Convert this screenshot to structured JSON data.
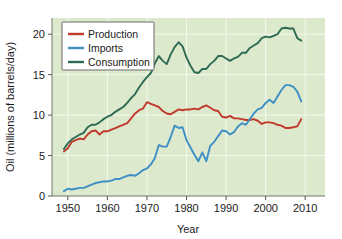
{
  "chart_data": {
    "type": "line",
    "title": "",
    "xlabel": "Year",
    "ylabel": "Oil (millions of barrels/day)",
    "xlim": [
      1946,
      2015
    ],
    "ylim": [
      0,
      22
    ],
    "xticks": [
      1950,
      1960,
      1970,
      1980,
      1990,
      2000,
      2010
    ],
    "xtick_labels": [
      "1950",
      "1960",
      "1970",
      "1980",
      "1990",
      "2000",
      "2010"
    ],
    "yticks": [
      0,
      5,
      10,
      15,
      20
    ],
    "ytick_labels": [
      "0",
      "5",
      "10",
      "15",
      "20"
    ],
    "grid": true,
    "grid_color": "#f4f8ee",
    "plot_background": "#dce9cd",
    "figure_background": "#ffffff",
    "legend_position": "upper-left-inside",
    "legend_entries": [
      "Production",
      "Imports",
      "Consumption"
    ],
    "x": [
      1949,
      1950,
      1951,
      1952,
      1953,
      1954,
      1955,
      1956,
      1957,
      1958,
      1959,
      1960,
      1961,
      1962,
      1963,
      1964,
      1965,
      1966,
      1967,
      1968,
      1969,
      1970,
      1971,
      1972,
      1973,
      1974,
      1975,
      1976,
      1977,
      1978,
      1979,
      1980,
      1981,
      1982,
      1983,
      1984,
      1985,
      1986,
      1987,
      1988,
      1989,
      1990,
      1991,
      1992,
      1993,
      1994,
      1995,
      1996,
      1997,
      1998,
      1999,
      2000,
      2001,
      2002,
      2003,
      2004,
      2005,
      2006,
      2007,
      2008,
      2009
    ],
    "series": [
      {
        "name": "Production",
        "color": "#c0392b",
        "values": [
          5.5,
          5.9,
          6.7,
          6.9,
          7.1,
          7.0,
          7.6,
          8.0,
          8.1,
          7.6,
          8.0,
          8.0,
          8.2,
          8.4,
          8.6,
          8.8,
          9.0,
          9.6,
          10.2,
          10.6,
          10.8,
          11.6,
          11.4,
          11.2,
          11.0,
          10.5,
          10.2,
          10.1,
          10.4,
          10.7,
          10.6,
          10.7,
          10.7,
          10.8,
          10.7,
          11.0,
          11.2,
          10.9,
          10.6,
          10.5,
          9.8,
          9.7,
          9.9,
          9.6,
          9.6,
          9.5,
          9.4,
          9.4,
          9.5,
          9.3,
          8.9,
          9.1,
          9.1,
          9.0,
          8.8,
          8.7,
          8.4,
          8.4,
          8.5,
          8.6,
          9.5
        ]
      },
      {
        "name": "Imports",
        "color": "#3e8fc4",
        "values": [
          0.6,
          0.9,
          0.8,
          0.9,
          1.0,
          1.0,
          1.2,
          1.4,
          1.6,
          1.7,
          1.8,
          1.8,
          1.9,
          2.1,
          2.1,
          2.3,
          2.5,
          2.6,
          2.5,
          2.8,
          3.2,
          3.4,
          3.9,
          4.7,
          6.3,
          6.1,
          6.1,
          7.3,
          8.7,
          8.4,
          8.5,
          6.9,
          6.0,
          5.1,
          4.3,
          5.4,
          4.3,
          6.2,
          6.7,
          7.4,
          8.1,
          8.0,
          7.6,
          7.9,
          8.6,
          9.0,
          8.8,
          9.5,
          10.2,
          10.7,
          10.9,
          11.5,
          11.9,
          11.5,
          12.3,
          13.1,
          13.7,
          13.7,
          13.5,
          12.9,
          11.7
        ]
      },
      {
        "name": "Consumption",
        "color": "#2d6b52",
        "values": [
          5.8,
          6.5,
          7.0,
          7.3,
          7.6,
          7.8,
          8.5,
          8.8,
          8.8,
          9.1,
          9.5,
          9.8,
          10.0,
          10.4,
          10.7,
          11.0,
          11.5,
          12.1,
          12.6,
          13.4,
          14.1,
          14.7,
          15.2,
          16.4,
          17.3,
          16.7,
          16.3,
          17.5,
          18.4,
          19.0,
          18.5,
          17.1,
          16.1,
          15.3,
          15.2,
          15.7,
          15.7,
          16.3,
          16.7,
          17.3,
          17.3,
          17.0,
          16.7,
          17.0,
          17.2,
          17.7,
          17.7,
          18.3,
          18.6,
          18.9,
          19.5,
          19.7,
          19.6,
          19.8,
          20.0,
          20.7,
          20.8,
          20.7,
          20.7,
          19.5,
          19.2
        ]
      }
    ]
  }
}
